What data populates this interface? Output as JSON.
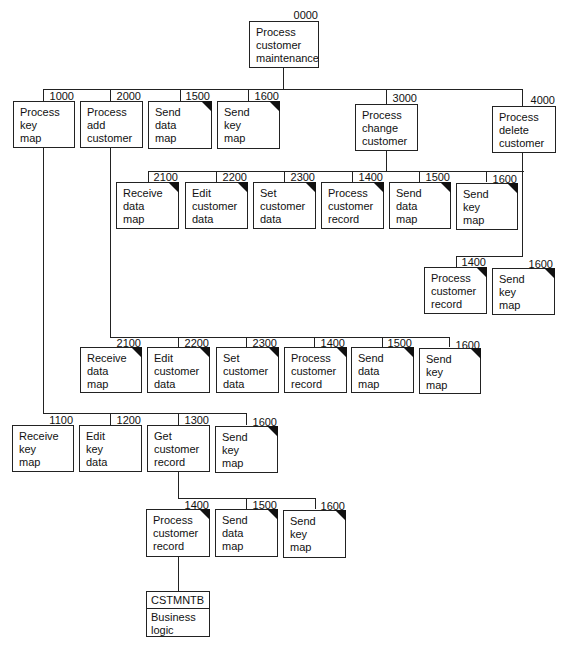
{
  "diagram": {
    "title_cut": "Figure: Structure chart for the customer maintenance program (cut off)",
    "root": {
      "code": "0000",
      "label": "Process\ncustomer\nmaintenance"
    },
    "level1": [
      {
        "code": "1000",
        "label": "Process\nkey\nmap",
        "common": false
      },
      {
        "code": "2000",
        "label": "Process\nadd\ncustomer",
        "common": false
      },
      {
        "code": "1500",
        "label": "Send\ndata\nmap",
        "common": true
      },
      {
        "code": "1600",
        "label": "Send\nkey\nmap",
        "common": true
      },
      {
        "code": "3000",
        "label": "Process\nchange\ncustomer",
        "common": false
      },
      {
        "code": "4000",
        "label": "Process\ndelete\ncustomer",
        "common": false
      }
    ],
    "change_children": [
      {
        "code": "2100",
        "label": "Receive\ndata\nmap",
        "common": true
      },
      {
        "code": "2200",
        "label": "Edit\ncustomer\ndata",
        "common": true
      },
      {
        "code": "2300",
        "label": "Set\ncustomer\ndata",
        "common": true
      },
      {
        "code": "1400",
        "label": "Process\ncustomer\nrecord",
        "common": true
      },
      {
        "code": "1500",
        "label": "Send\ndata\nmap",
        "common": true
      },
      {
        "code": "1600",
        "label": "Send\nkey\nmap",
        "common": true
      }
    ],
    "delete_children": [
      {
        "code": "1400",
        "label": "Process\ncustomer\nrecord",
        "common": true
      },
      {
        "code": "1600",
        "label": "Send\nkey\nmap",
        "common": true
      }
    ],
    "add_children": [
      {
        "code": "2100",
        "label": "Receive\ndata\nmap",
        "common": true
      },
      {
        "code": "2200",
        "label": "Edit\ncustomer\ndata",
        "common": true
      },
      {
        "code": "2300",
        "label": "Set\ncustomer\ndata",
        "common": true
      },
      {
        "code": "1400",
        "label": "Process\ncustomer\nrecord",
        "common": true
      },
      {
        "code": "1500",
        "label": "Send\ndata\nmap",
        "common": true
      },
      {
        "code": "1600",
        "label": "Send\nkey\nmap",
        "common": true
      }
    ],
    "keymap_children": [
      {
        "code": "1100",
        "label": "Receive\nkey\nmap",
        "common": false
      },
      {
        "code": "1200",
        "label": "Edit\nkey\ndata",
        "common": false
      },
      {
        "code": "1300",
        "label": "Get\ncustomer\nrecord",
        "common": false
      },
      {
        "code": "1600",
        "label": "Send\nkey\nmap",
        "common": true
      }
    ],
    "getrecord_children": [
      {
        "code": "1400",
        "label": "Process\ncustomer\nrecord",
        "common": true
      },
      {
        "code": "1500",
        "label": "Send\ndata\nmap",
        "common": true
      },
      {
        "code": "1600",
        "label": "Send\nkey\nmap",
        "common": true
      }
    ],
    "external": {
      "name": "CSTMNTB",
      "label": "Business\nlogic"
    }
  }
}
